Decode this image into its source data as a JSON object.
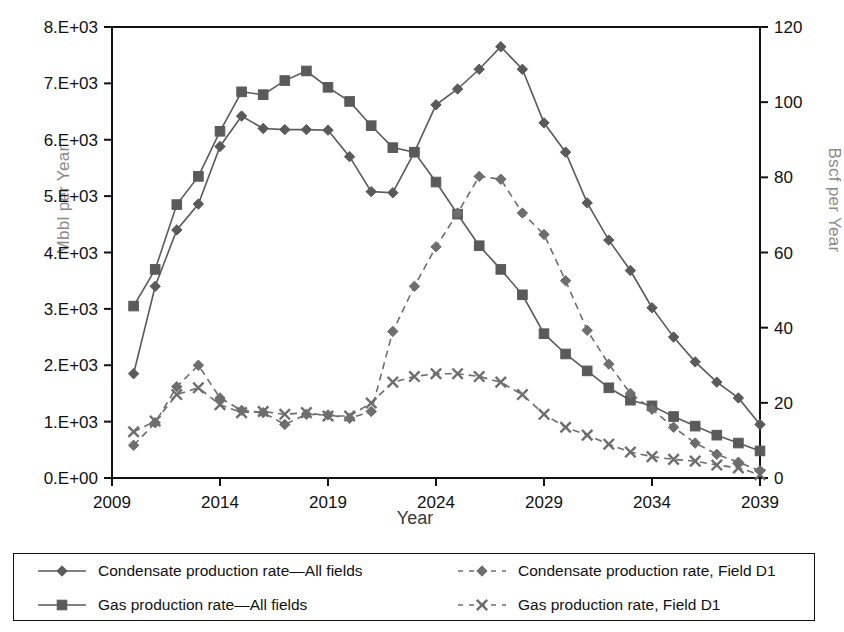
{
  "chart_data": {
    "type": "line",
    "title": "",
    "xlabel": "Year",
    "ylabel": "Mbbl per Year",
    "ylabel_secondary": "Bscf per Year",
    "xlim": [
      2009,
      2039
    ],
    "ylim": [
      0,
      8000
    ],
    "ylim_secondary": [
      0,
      120
    ],
    "xticks": [
      "2009",
      "2014",
      "2019",
      "2024",
      "2029",
      "2034",
      "2039"
    ],
    "yticks": [
      "0.E+00",
      "1.E+03",
      "2.E+03",
      "3.E+03",
      "4.E+03",
      "5.E+03",
      "6.E+03",
      "7.E+03",
      "8.E+03"
    ],
    "yticks_secondary": [
      "0",
      "20",
      "40",
      "60",
      "80",
      "100",
      "120"
    ],
    "grid": false,
    "legend_position": "bottom",
    "x": [
      2010,
      2011,
      2012,
      2013,
      2014,
      2015,
      2016,
      2017,
      2018,
      2019,
      2020,
      2021,
      2022,
      2023,
      2024,
      2025,
      2026,
      2027,
      2028,
      2029,
      2030,
      2031,
      2032,
      2033,
      2034,
      2035,
      2036,
      2037,
      2038,
      2039
    ],
    "series": [
      {
        "name": "Condensate production rate—All fields",
        "marker": "diamond",
        "linestyle": "solid",
        "axis": "left",
        "color": "#5a5a5a",
        "values": [
          1850,
          3400,
          4400,
          4860,
          5880,
          6420,
          6200,
          6180,
          6180,
          6170,
          5700,
          5080,
          5060,
          5780,
          6620,
          6900,
          7250,
          7650,
          7250,
          6300,
          5780,
          4880,
          4220,
          3680,
          3020,
          2500,
          2060,
          1700,
          1420,
          950
        ]
      },
      {
        "name": "Gas production rate—All fields",
        "marker": "square",
        "linestyle": "solid",
        "axis": "left",
        "values_note": "plotted on left axis scale as Mbbl-equivalent trace",
        "color": "#5a5a5a",
        "values": [
          3050,
          3700,
          4850,
          5350,
          6150,
          6850,
          6800,
          7050,
          7220,
          6930,
          6680,
          6250,
          5860,
          5780,
          5250,
          4680,
          4120,
          3700,
          3250,
          2560,
          2200,
          1900,
          1600,
          1380,
          1280,
          1090,
          920,
          760,
          620,
          480
        ]
      },
      {
        "name": "Condensate production rate, Field D1",
        "marker": "diamond",
        "linestyle": "dashed",
        "axis": "left",
        "color": "#6e6e6e",
        "values": [
          580,
          980,
          1620,
          2000,
          1420,
          1200,
          1160,
          950,
          1130,
          1120,
          1060,
          1180,
          2600,
          3400,
          4100,
          4700,
          5350,
          5300,
          4700,
          4320,
          3500,
          2620,
          2020,
          1500,
          1220,
          900,
          620,
          420,
          280,
          130
        ]
      },
      {
        "name": "Gas production rate, Field D1",
        "marker": "x",
        "linestyle": "dashed",
        "axis": "left",
        "color": "#6e6e6e",
        "values": [
          820,
          1010,
          1480,
          1600,
          1300,
          1160,
          1180,
          1130,
          1160,
          1100,
          1100,
          1330,
          1700,
          1800,
          1850,
          1850,
          1800,
          1700,
          1480,
          1130,
          900,
          760,
          600,
          460,
          380,
          330,
          300,
          230,
          180,
          60
        ]
      }
    ]
  },
  "legend": {
    "items": [
      {
        "label": "Condensate production rate—All fields",
        "marker": "diamond",
        "linestyle": "solid"
      },
      {
        "label": "Condensate production rate, Field D1",
        "marker": "diamond",
        "linestyle": "dashed"
      },
      {
        "label": "Gas production rate—All fields",
        "marker": "square",
        "linestyle": "solid"
      },
      {
        "label": "Gas production rate, Field D1",
        "marker": "x",
        "linestyle": "dashed"
      }
    ]
  },
  "colors": {
    "series": "#5a5a5a",
    "series_dashed": "#6e6e6e",
    "axis": "#111111",
    "axis_title": "#8b8b8b"
  }
}
